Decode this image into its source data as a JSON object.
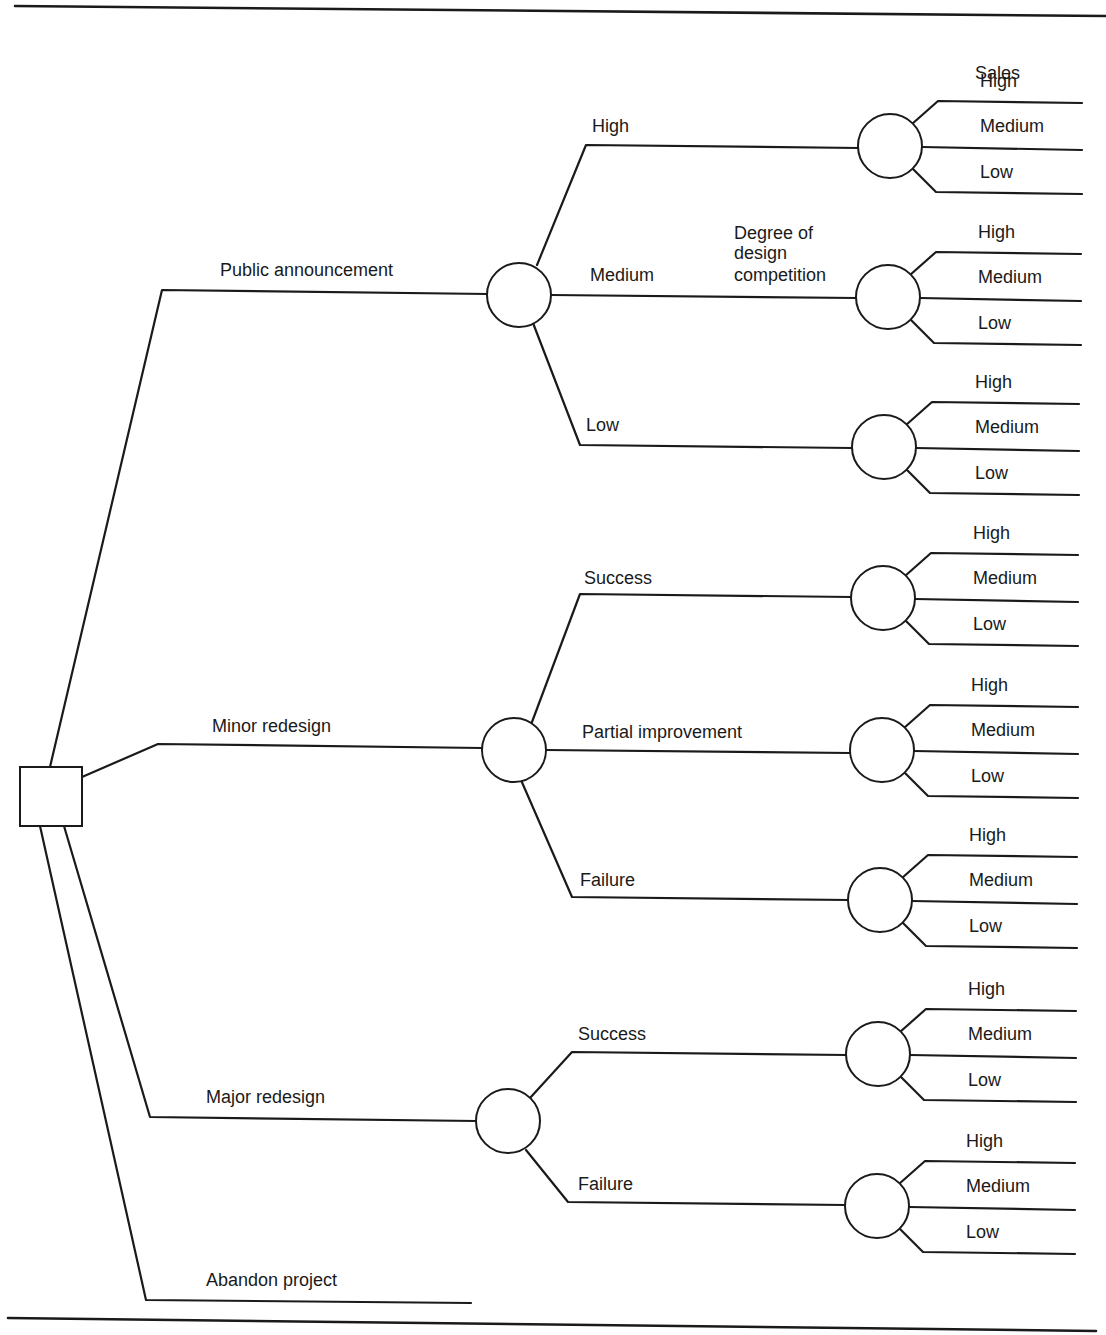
{
  "figure": {
    "title_partial": "Figure 1: Decision Tree for Design Development Decision 1100",
    "stroke_color": "#1a1a1a",
    "background": "#ffffff"
  },
  "decision_node": {
    "label": "",
    "x": 20,
    "y": 767,
    "w": 62,
    "h": 59
  },
  "labels": {
    "sales_header": "Sales",
    "design_competition": [
      "Degree of",
      "design",
      "competition"
    ]
  },
  "alternatives": [
    {
      "label": "Public announcement",
      "elbow": [
        162,
        290
      ],
      "end": [
        488,
        294
      ],
      "label_pos": [
        220,
        276
      ],
      "start": [
        50,
        767
      ],
      "chance_node": {
        "cx": 519,
        "cy": 295,
        "r": 32
      }
    },
    {
      "label": "Minor redesign",
      "elbow": [
        158,
        744
      ],
      "end": [
        482,
        748
      ],
      "label_pos": [
        212,
        732
      ],
      "start": [
        82,
        777
      ],
      "chance_node": {
        "cx": 514,
        "cy": 750,
        "r": 32
      }
    },
    {
      "label": "Major redesign",
      "elbow": [
        150,
        1117
      ],
      "end": [
        476,
        1121
      ],
      "label_pos": [
        206,
        1103
      ],
      "start": [
        64,
        826
      ],
      "chance_node": {
        "cx": 508,
        "cy": 1121,
        "r": 32
      }
    },
    {
      "label": "Abandon project",
      "elbow": [
        146,
        1300
      ],
      "end": [
        471,
        1303
      ],
      "label_pos": [
        206,
        1286
      ],
      "start": [
        40,
        826
      ],
      "chance_node": null
    }
  ],
  "outcomes": [
    {
      "parent": 0,
      "label": "High",
      "from": [
        537,
        265
      ],
      "elbow": [
        586,
        145
      ],
      "end": [
        859,
        148
      ],
      "label_pos": [
        592,
        132
      ],
      "chance_node": {
        "cx": 890,
        "cy": 146,
        "r": 32
      }
    },
    {
      "parent": 0,
      "label": "Medium",
      "from": [
        551,
        295
      ],
      "elbow": [
        551,
        295
      ],
      "end": [
        857,
        298
      ],
      "label_pos": [
        590,
        281
      ],
      "chance_node": {
        "cx": 888,
        "cy": 297,
        "r": 32
      }
    },
    {
      "parent": 0,
      "label": "Low",
      "from": [
        533,
        323
      ],
      "elbow": [
        580,
        445
      ],
      "end": [
        852,
        448
      ],
      "label_pos": [
        586,
        431
      ],
      "chance_node": {
        "cx": 884,
        "cy": 447,
        "r": 32
      }
    },
    {
      "parent": 1,
      "label": "Success",
      "from": [
        532,
        722
      ],
      "elbow": [
        580,
        594
      ],
      "end": [
        852,
        597
      ],
      "label_pos": [
        584,
        584
      ],
      "chance_node": {
        "cx": 883,
        "cy": 598,
        "r": 32
      }
    },
    {
      "parent": 1,
      "label": "Partial improvement",
      "from": [
        546,
        750
      ],
      "elbow": [
        546,
        750
      ],
      "end": [
        851,
        753
      ],
      "label_pos": [
        582,
        738
      ],
      "chance_node": {
        "cx": 882,
        "cy": 750,
        "r": 32
      }
    },
    {
      "parent": 1,
      "label": "Failure",
      "from": [
        521,
        780
      ],
      "elbow": [
        572,
        897
      ],
      "end": [
        849,
        900
      ],
      "label_pos": [
        580,
        886
      ],
      "chance_node": {
        "cx": 880,
        "cy": 900,
        "r": 32
      }
    },
    {
      "parent": 2,
      "label": "Success",
      "from": [
        530,
        1098
      ],
      "elbow": [
        572,
        1052
      ],
      "end": [
        847,
        1055
      ],
      "label_pos": [
        578,
        1040
      ],
      "chance_node": {
        "cx": 878,
        "cy": 1054,
        "r": 32
      }
    },
    {
      "parent": 2,
      "label": "Failure",
      "from": [
        526,
        1150
      ],
      "elbow": [
        568,
        1202
      ],
      "end": [
        846,
        1205
      ],
      "label_pos": [
        578,
        1190
      ],
      "chance_node": {
        "cx": 877,
        "cy": 1206,
        "r": 32
      }
    }
  ],
  "sales_branches": {
    "labels": [
      "High",
      "Medium",
      "Low"
    ],
    "line_end_x": 1082,
    "groups": [
      {
        "cy": 146,
        "cx": 890,
        "label_x": 980
      },
      {
        "cy": 297,
        "cx": 888,
        "label_x": 978
      },
      {
        "cy": 447,
        "cx": 884,
        "label_x": 975
      },
      {
        "cy": 598,
        "cx": 883,
        "label_x": 973
      },
      {
        "cy": 750,
        "cx": 882,
        "label_x": 971
      },
      {
        "cy": 900,
        "cx": 880,
        "label_x": 969
      },
      {
        "cy": 1054,
        "cx": 878,
        "label_x": 968
      },
      {
        "cy": 1206,
        "cx": 877,
        "label_x": 966
      }
    ]
  },
  "rules": {
    "top": {
      "x1": 15,
      "y1": 6,
      "x2": 1106,
      "y2": 16
    },
    "bottom": {
      "x1": 8,
      "y1": 1318,
      "x2": 1096,
      "y2": 1331
    }
  },
  "chart_data": {
    "type": "decision_tree",
    "root": "decision",
    "alternatives": [
      {
        "name": "Public announcement",
        "event": "Degree of design competition",
        "outcomes": [
          "High",
          "Medium",
          "Low"
        ],
        "then": {
          "event": "Sales",
          "outcomes": [
            "High",
            "Medium",
            "Low"
          ]
        }
      },
      {
        "name": "Minor redesign",
        "outcomes": [
          "Success",
          "Partial improvement",
          "Failure"
        ],
        "then": {
          "event": "Sales",
          "outcomes": [
            "High",
            "Medium",
            "Low"
          ]
        }
      },
      {
        "name": "Major redesign",
        "outcomes": [
          "Success",
          "Failure"
        ],
        "then": {
          "event": "Sales",
          "outcomes": [
            "High",
            "Medium",
            "Low"
          ]
        }
      },
      {
        "name": "Abandon project",
        "outcomes": []
      }
    ]
  }
}
